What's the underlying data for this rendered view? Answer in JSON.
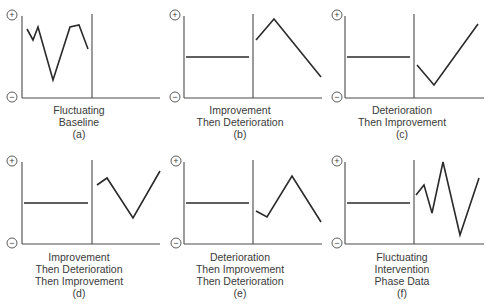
{
  "figure": {
    "panels": [
      {
        "id": "a",
        "title_lines": [
          "Fluctuating",
          "Baseline",
          "(a)"
        ],
        "pattern": "fluctuating-baseline",
        "baseline_phase": [
          [
            27,
            29
          ],
          [
            33,
            40
          ],
          [
            38,
            27
          ],
          [
            53,
            80
          ],
          [
            70,
            27
          ],
          [
            79,
            25
          ],
          [
            88,
            49
          ]
        ],
        "intervention_phase": []
      },
      {
        "id": "b",
        "title_lines": [
          "Improvement",
          "Then Deterioration",
          "(b)"
        ],
        "pattern": "improvement-then-deterioration",
        "baseline_phase": [
          [
            186,
            57
          ],
          [
            249,
            57
          ]
        ],
        "intervention_phase": [
          [
            256,
            40
          ],
          [
            274,
            19
          ],
          [
            321,
            77
          ]
        ]
      },
      {
        "id": "c",
        "title_lines": [
          "Deterioration",
          "Then Improvement",
          "(c)"
        ],
        "pattern": "deterioration-then-improvement",
        "baseline_phase": [
          [
            347,
            57
          ],
          [
            410,
            57
          ]
        ],
        "intervention_phase": [
          [
            417,
            65
          ],
          [
            434,
            85
          ],
          [
            478,
            24
          ]
        ]
      },
      {
        "id": "d",
        "title_lines": [
          "Improvement",
          "Then Deterioration",
          "Then Improvement",
          "(d)"
        ],
        "pattern": "improvement-deterioration-improvement",
        "baseline_phase": [
          [
            24,
            203
          ],
          [
            88,
            203
          ]
        ],
        "intervention_phase": [
          [
            97,
            185
          ],
          [
            107,
            178
          ],
          [
            133,
            218
          ],
          [
            160,
            171
          ]
        ]
      },
      {
        "id": "e",
        "title_lines": [
          "Deterioration",
          "Then Improvement",
          "Then Deterioration",
          "(e)"
        ],
        "pattern": "deterioration-improvement-deterioration",
        "baseline_phase": [
          [
            186,
            203
          ],
          [
            249,
            203
          ]
        ],
        "intervention_phase": [
          [
            256,
            211
          ],
          [
            267,
            217
          ],
          [
            292,
            176
          ],
          [
            321,
            222
          ]
        ]
      },
      {
        "id": "f",
        "title_lines": [
          "Fluctuating",
          "Intervention",
          "Phase Data",
          "(f)"
        ],
        "pattern": "fluctuating-intervention",
        "baseline_phase": [
          [
            347,
            203
          ],
          [
            410,
            203
          ]
        ],
        "intervention_phase": [
          [
            416,
            195
          ],
          [
            424,
            185
          ],
          [
            432,
            213
          ],
          [
            443,
            162
          ],
          [
            460,
            235
          ],
          [
            479,
            178
          ]
        ]
      }
    ],
    "axis_symbols": {
      "top": "+",
      "bottom": "−"
    },
    "colors": {
      "line": "#2a2a2a",
      "axis": "#4a4a4a",
      "text": "#3a3a3a"
    }
  }
}
